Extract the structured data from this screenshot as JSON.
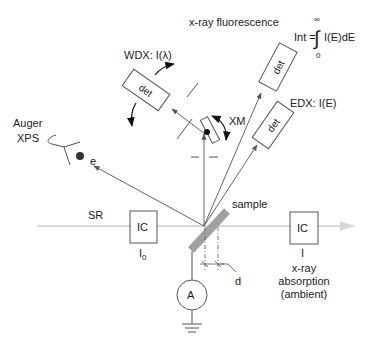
{
  "diagram": {
    "title": "x-ray fluorescence",
    "formula": {
      "lhs": "Int =",
      "integrand": "I(E)dE",
      "upper_limit": "∞",
      "lower_limit": "0"
    },
    "labels": {
      "wdx": "WDX: I(λ)",
      "edx": "EDX: I(E)",
      "xm": "XM",
      "auger": "Auger",
      "xps": "XPS",
      "electron": "e",
      "sr": "SR",
      "sample": "sample",
      "d": "d",
      "ammeter": "A",
      "ic_left": "IC",
      "ic_right": "IC",
      "i0_main": "I",
      "i0_sub": "0",
      "i": "I",
      "absorption_line1": "x-ray",
      "absorption_line2": "absorption",
      "absorption_line3": "(ambient)",
      "det_wdx": "det",
      "det_fluor": "det",
      "det_edx": "det"
    },
    "colors": {
      "line": "#555555",
      "beam": "#d8d8d8",
      "sample": "#a0a0a0",
      "arrow": "#555555",
      "text": "#222222"
    }
  }
}
